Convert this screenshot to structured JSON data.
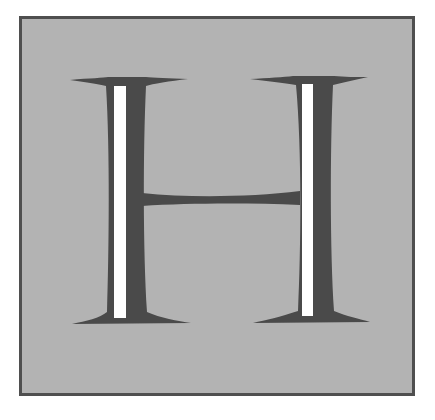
{
  "initial": {
    "letter": "H",
    "style": "decorative inline serif drop capital",
    "colors": {
      "background": "#b3b3b3",
      "border": "#4f4f4f",
      "letter_fill": "#4a4a4a",
      "inline_highlight": "#ffffff"
    }
  }
}
